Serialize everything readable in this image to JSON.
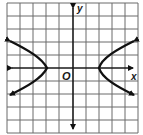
{
  "graph": {
    "title": "",
    "x_axis_label": "x",
    "y_axis_label": "y",
    "origin_label": "O",
    "grid": {
      "cells_x": 10,
      "cells_y": 10,
      "line_color": "#6b6b6b"
    },
    "axis_color": "#1a1a1a",
    "curve_color": "#111111",
    "curve": {
      "type": "hyperbola",
      "orientation": "horizontal",
      "vertices": [
        [
          -2,
          0
        ],
        [
          2,
          0
        ]
      ],
      "left_branch_arrows": [
        [
          -5,
          2
        ],
        [
          -5,
          -2
        ]
      ],
      "right_branch_arrows": [
        [
          5,
          2
        ],
        [
          5,
          -2
        ]
      ]
    }
  }
}
